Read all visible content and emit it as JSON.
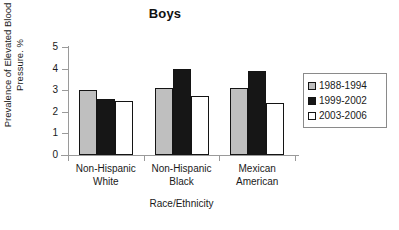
{
  "chart_data": {
    "type": "bar",
    "title": "Boys",
    "xlabel": "Race/Ethnicity",
    "ylabel_line1": "Prevalence of Elevated Blood",
    "ylabel_line2": "Pressure. %",
    "categories": [
      {
        "line1": "Non-Hispanic",
        "line2": "White"
      },
      {
        "line1": "Non-Hispanic",
        "line2": "Black"
      },
      {
        "line1": "Mexican",
        "line2": "American"
      }
    ],
    "series": [
      {
        "name": "1988-1994",
        "color": "#bfbfbf",
        "values": [
          3.0,
          3.1,
          3.1
        ]
      },
      {
        "name": "1999-2002",
        "color": "#161616",
        "values": [
          2.6,
          4.0,
          3.9
        ]
      },
      {
        "name": "2003-2006",
        "color": "#ffffff",
        "values": [
          2.5,
          2.75,
          2.4
        ]
      }
    ],
    "ylim": [
      0,
      5
    ],
    "yticks": [
      0,
      1,
      2,
      3,
      4,
      5
    ],
    "grid": false,
    "legend_position": "right"
  }
}
